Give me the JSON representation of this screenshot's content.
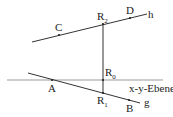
{
  "diagram": {
    "plane_label": "x-y-Ebene",
    "lines": {
      "g": "g",
      "h": "h"
    },
    "points": {
      "A": "A",
      "B": "B",
      "C": "C",
      "D": "D",
      "R0": {
        "base": "R",
        "sub": "0"
      },
      "R1": {
        "base": "R",
        "sub": "1"
      },
      "R2": {
        "base": "R",
        "sub": "2"
      }
    },
    "colors": {
      "plane_line": "#9a9a9a",
      "lines": "#333333",
      "text": "#222222"
    }
  }
}
